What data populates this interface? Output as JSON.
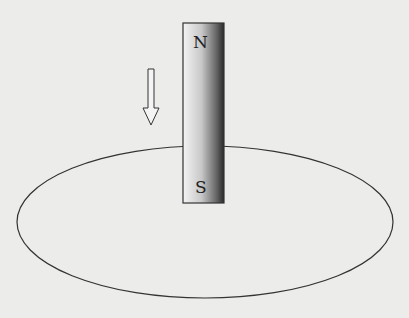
{
  "diagram": {
    "magnet": {
      "north_label": "N",
      "south_label": "S"
    },
    "arrow": {
      "direction": "down",
      "icon": "hollow-down-arrow-icon"
    },
    "loop": {
      "shape": "ellipse"
    },
    "colors": {
      "background": "#ececea",
      "stroke": "#333333",
      "magnet_light": "#f2f2f2",
      "magnet_dark": "#2a2a2a"
    }
  }
}
